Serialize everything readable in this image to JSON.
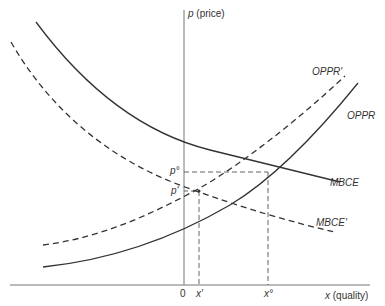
{
  "axes": {
    "y_label_var": "p",
    "y_label_text": " (price)",
    "x_label_var": "x",
    "x_label_text": " (quality)",
    "origin": "0"
  },
  "curves": [
    {
      "name": "OPPR",
      "style": "solid",
      "label": "OPPR"
    },
    {
      "name": "OPPR'",
      "style": "dashed",
      "label": "OPPR'"
    },
    {
      "name": "MBCE",
      "style": "solid",
      "label": "MBCE"
    },
    {
      "name": "MBCE'",
      "style": "dashed",
      "label": "MBCE'"
    }
  ],
  "ticks": {
    "p0": "p°",
    "p1": "p'",
    "x1": "x'",
    "x0": "x°"
  },
  "colors": {
    "line": "#333333",
    "axis": "#777777",
    "guide": "#555555"
  }
}
